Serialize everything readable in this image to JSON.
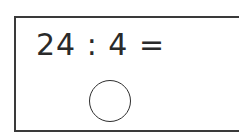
{
  "exercise": {
    "equation": "24 : 4 =",
    "answer_value": ""
  },
  "colors": {
    "border": "#3a3a3a",
    "text": "#2a2a2a",
    "background": "#ffffff"
  }
}
